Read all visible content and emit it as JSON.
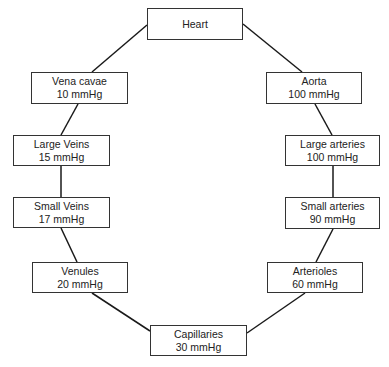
{
  "diagram": {
    "type": "circulation-pressure-loop",
    "nodes": [
      {
        "id": "heart",
        "label": "Heart",
        "value": ""
      },
      {
        "id": "vena_cavae",
        "label": "Vena cavae",
        "value": "10 mmHg"
      },
      {
        "id": "aorta",
        "label": "Aorta",
        "value": "100 mmHg"
      },
      {
        "id": "large_veins",
        "label": "Large Veins",
        "value": "15 mmHg"
      },
      {
        "id": "large_arteries",
        "label": "Large arteries",
        "value": "100 mmHg"
      },
      {
        "id": "small_veins",
        "label": "Small Veins",
        "value": "17 mmHg"
      },
      {
        "id": "small_arteries",
        "label": "Small arteries",
        "value": "90 mmHg"
      },
      {
        "id": "venules",
        "label": "Venules",
        "value": "20 mmHg"
      },
      {
        "id": "arterioles",
        "label": "Arterioles",
        "value": "60 mmHg"
      },
      {
        "id": "capillaries",
        "label": "Capillaries",
        "value": "30 mmHg"
      }
    ],
    "edges": [
      [
        "heart",
        "aorta"
      ],
      [
        "aorta",
        "large_arteries"
      ],
      [
        "large_arteries",
        "small_arteries"
      ],
      [
        "small_arteries",
        "arterioles"
      ],
      [
        "arterioles",
        "capillaries"
      ],
      [
        "capillaries",
        "venules"
      ],
      [
        "venules",
        "small_veins"
      ],
      [
        "small_veins",
        "large_veins"
      ],
      [
        "large_veins",
        "vena_cavae"
      ],
      [
        "vena_cavae",
        "heart"
      ]
    ]
  }
}
